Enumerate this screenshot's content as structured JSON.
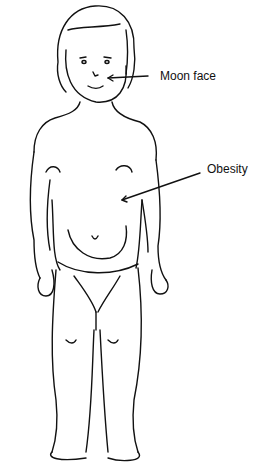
{
  "figure": {
    "labels": [
      {
        "id": "moon-face",
        "text": "Moon face"
      },
      {
        "id": "obesity",
        "text": "Obesity"
      }
    ]
  }
}
